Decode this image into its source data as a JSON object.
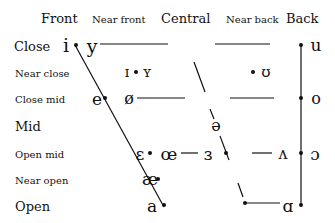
{
  "columns": {
    "front": "Front",
    "near_front": "Near front",
    "central": "Central",
    "near_back": "Near back",
    "back": "Back"
  },
  "rows": {
    "close": "Close",
    "near_close": "Near close",
    "close_mid": "Close mid",
    "mid": "Mid",
    "open_mid": "Open mid",
    "near_open": "Near open",
    "open": "Open"
  },
  "vowels": {
    "i": "i",
    "y": "y",
    "ih": "ɪ",
    "yh": "ʏ",
    "uh": "ʊ",
    "u": "u",
    "e": "e",
    "oe_slash": "ø",
    "o": "o",
    "schwa": "ə",
    "eps": "ɛ",
    "oe": "œ",
    "rev_eps": "ɜ",
    "wedge": "ʌ",
    "open_o": "ɔ",
    "ae": "æ",
    "a": "a",
    "script_a": "ɑ"
  },
  "colors": {
    "ink": "#111111",
    "background": "#ffffff"
  }
}
